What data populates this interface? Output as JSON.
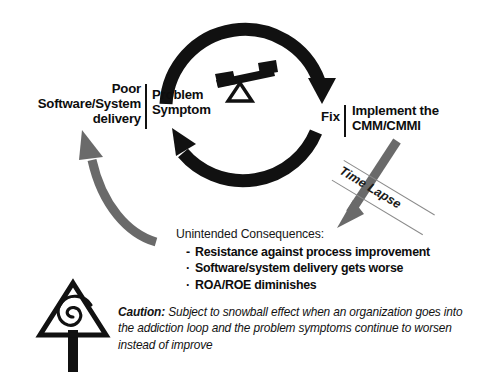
{
  "diagram": {
    "background_color": "#ffffff",
    "ink_color": "#0d0d0d",
    "gray_arrow_color": "#6a6a6a"
  },
  "loop": {
    "left_node": {
      "outcome_label": "Poor\nSoftware/System\ndelivery",
      "node_label": "Problem\nSymptom"
    },
    "right_node": {
      "node_label": "Fix",
      "action_label": "Implement the\nCMM/CMMI"
    },
    "icons": {
      "balance": "seesaw-balance-icon",
      "top_arc": "clockwise-arrow-icon",
      "bottom_arc": "counterclockwise-arrow-icon",
      "left_feedback": "curved-gray-arrow-icon",
      "right_delay": "straight-gray-arrow-icon",
      "caution": "caution-spiral-sign-icon"
    }
  },
  "time_lapse": {
    "label": "Time Lapse"
  },
  "consequences": {
    "heading": "Unintended Consequences:",
    "items": [
      {
        "marker": "-",
        "text": "Resistance against process improvement"
      },
      {
        "marker": "·",
        "text": "Software/system delivery gets worse"
      },
      {
        "marker": "·",
        "text": "ROA/ROE diminishes"
      }
    ]
  },
  "caution": {
    "label": "Caution:",
    "text": " Subject to snowball effect when an organization goes into the addiction loop and the problem symptoms continue to worsen instead of improve"
  }
}
